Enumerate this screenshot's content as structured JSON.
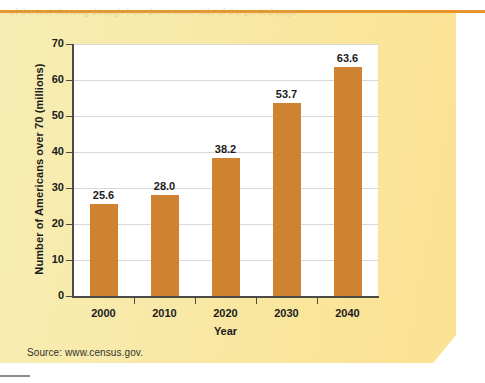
{
  "chart_data": {
    "type": "bar",
    "title": "",
    "categories": [
      "2000",
      "2010",
      "2020",
      "2030",
      "2040"
    ],
    "values": [
      25.6,
      28.0,
      38.2,
      53.7,
      63.6
    ],
    "value_labels": [
      "25.6",
      "28.0",
      "38.2",
      "53.7",
      "63.6"
    ],
    "xlabel": "Year",
    "ylabel": "Number of Americans over 70 (millions)",
    "ylim": [
      0,
      70
    ],
    "yticks": [
      0,
      10,
      20,
      30,
      40,
      50,
      60,
      70
    ],
    "ytick_labels": [
      "0",
      "10",
      "20",
      "30",
      "40",
      "50",
      "60",
      "70"
    ],
    "grid": "horizontal",
    "legend": "none",
    "bar_color": "#cf8230",
    "plot_background": "#ffffff"
  },
  "figure": {
    "source_note": "Source: www.census.gov.",
    "panel_color": "#f8e8a4",
    "rule_color": "#e8962c"
  },
  "background_text": {
    "line1": "of the text showing through from the reverse side of the printed page",
    "line2": "faint offset impression of body copy and headings beneath",
    "line3": "show-through artifact of scanned textbook page"
  }
}
